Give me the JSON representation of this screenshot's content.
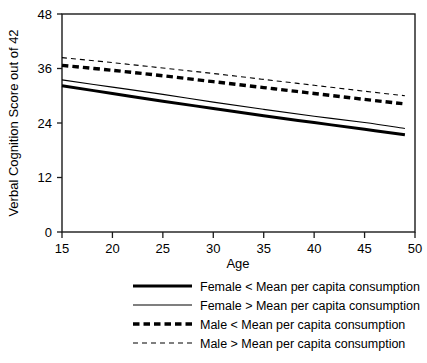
{
  "chart_data": {
    "type": "line",
    "title": "",
    "subtitle": "",
    "xlabel": "Age",
    "ylabel": "Verbal Cognition Score out of 42",
    "xlim": [
      15,
      50
    ],
    "ylim": [
      0,
      48
    ],
    "xticks": [
      15,
      20,
      25,
      30,
      35,
      40,
      45,
      50
    ],
    "xtick_labels": [
      "15",
      "20",
      "25",
      "30",
      "35",
      "40",
      "45",
      "50"
    ],
    "yticks": [
      0,
      12,
      24,
      36,
      48
    ],
    "ytick_labels": [
      "0",
      "12",
      "24",
      "36",
      "48"
    ],
    "grid": false,
    "legend_position": "below",
    "frame": "box",
    "x": [
      15,
      20,
      25,
      30,
      35,
      40,
      45,
      49
    ],
    "series": [
      {
        "name": "Female < Mean per capita consumption",
        "label": "Female < Mean per capita consumption",
        "style": "solid",
        "width": "thick",
        "color": "#000000",
        "values": [
          32.2,
          30.5,
          28.8,
          27.2,
          25.6,
          24.1,
          22.6,
          21.4
        ]
      },
      {
        "name": "Female > Mean per capita consumption",
        "label": "Female > Mean per capita consumption",
        "style": "solid",
        "width": "thin",
        "color": "#000000",
        "values": [
          33.5,
          31.9,
          30.3,
          28.6,
          27.0,
          25.5,
          24.1,
          22.8
        ]
      },
      {
        "name": "Male < Mean per capita consumption",
        "label": "Male < Mean per capita consumption",
        "style": "dashed",
        "width": "thick",
        "color": "#000000",
        "values": [
          36.7,
          35.6,
          34.4,
          33.1,
          31.8,
          30.5,
          29.2,
          28.2
        ]
      },
      {
        "name": "Male > Mean per capita consumption",
        "label": "Male > Mean per capita consumption",
        "style": "dashed",
        "width": "thin",
        "color": "#000000",
        "values": [
          38.4,
          37.3,
          36.1,
          34.9,
          33.6,
          32.3,
          31.0,
          30.0
        ]
      }
    ]
  },
  "legend": {
    "items": [
      {
        "label": "Female < Mean per capita consumption"
      },
      {
        "label": "Female > Mean per capita consumption"
      },
      {
        "label": "Male < Mean per capita consumption"
      },
      {
        "label": "Male > Mean per capita consumption"
      }
    ]
  },
  "colors": {
    "ink": "#000000",
    "axis": "#1a1a1a",
    "background": "#ffffff"
  }
}
